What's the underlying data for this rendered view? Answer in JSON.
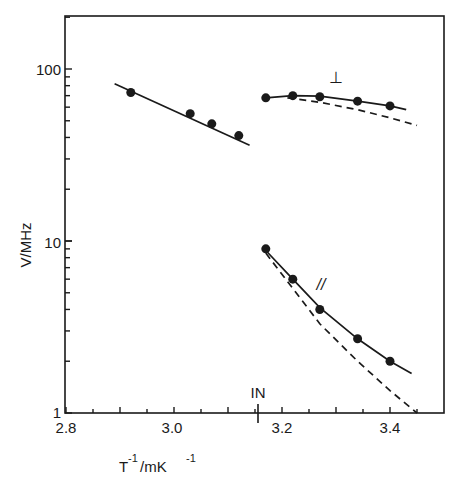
{
  "chart_data": {
    "type": "scatter",
    "title": "",
    "xlabel": "T^-1 / mK^-1",
    "ylabel": "V/MHz",
    "xlim": [
      2.8,
      3.5
    ],
    "ylim": [
      1,
      200
    ],
    "yscale": "log",
    "grid": false,
    "legend": "none",
    "x_ticks": [
      2.8,
      3.0,
      3.2,
      3.4
    ],
    "x_tick_labels": [
      "2.8",
      "3.0",
      "3.2",
      "3.4"
    ],
    "y_ticks": [
      1,
      10,
      100
    ],
    "y_tick_labels": [
      "1",
      "10",
      "100"
    ],
    "annotations": [
      {
        "text": "IN",
        "x": 3.16,
        "note": "isotropic-nematic transition marker"
      },
      {
        "text": "⊥",
        "x": 3.29,
        "y": 95
      },
      {
        "text": "//",
        "x": 3.28,
        "y": 5.5
      }
    ],
    "series": [
      {
        "name": "isotropic",
        "points": [
          [
            2.92,
            73
          ],
          [
            3.03,
            55
          ],
          [
            3.07,
            48
          ],
          [
            3.12,
            41
          ]
        ],
        "fit_line": [
          [
            2.89,
            82
          ],
          [
            3.14,
            36
          ]
        ],
        "line_style": "solid"
      },
      {
        "name": "perpendicular (⊥)",
        "points": [
          [
            3.17,
            68
          ],
          [
            3.22,
            70
          ],
          [
            3.27,
            69
          ],
          [
            3.34,
            65
          ],
          [
            3.4,
            61
          ]
        ],
        "fit_curve": [
          [
            3.17,
            68
          ],
          [
            3.22,
            70
          ],
          [
            3.27,
            69.5
          ],
          [
            3.34,
            65
          ],
          [
            3.4,
            61
          ],
          [
            3.43,
            58
          ]
        ],
        "dashed_curve": [
          [
            3.21,
            68
          ],
          [
            3.27,
            64
          ],
          [
            3.34,
            58
          ],
          [
            3.4,
            52
          ],
          [
            3.45,
            47
          ]
        ]
      },
      {
        "name": "parallel (//)",
        "points": [
          [
            3.17,
            9
          ],
          [
            3.22,
            6
          ],
          [
            3.27,
            4
          ],
          [
            3.34,
            2.7
          ],
          [
            3.4,
            2.0
          ]
        ],
        "fit_curve": [
          [
            3.17,
            8.8
          ],
          [
            3.22,
            6.0
          ],
          [
            3.27,
            4.1
          ],
          [
            3.34,
            2.7
          ],
          [
            3.4,
            2.0
          ],
          [
            3.44,
            1.7
          ]
        ],
        "dashed_curve": [
          [
            3.17,
            8.5
          ],
          [
            3.22,
            5.3
          ],
          [
            3.27,
            3.3
          ],
          [
            3.34,
            2.0
          ],
          [
            3.4,
            1.35
          ],
          [
            3.45,
            1.0
          ]
        ]
      }
    ]
  },
  "labels": {
    "y_axis": "V/MHz",
    "x_axis_T": "T",
    "x_axis_sup1": "-1",
    "x_axis_unit": "/mK",
    "x_axis_sup2": "-1",
    "tick_x_0": "2.8",
    "tick_x_1": "3.0",
    "tick_x_2": "3.2",
    "tick_x_3": "3.4",
    "tick_y_0": "1",
    "tick_y_1": "10",
    "tick_y_2": "100",
    "in_marker": "IN",
    "perp_label": "⊥",
    "para_label": "//"
  }
}
